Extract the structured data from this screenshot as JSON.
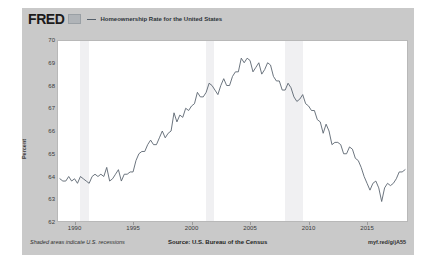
{
  "header": {
    "logo_text": "FRED",
    "logo_mark_name": "fred-graph-mark-icon",
    "series_title": "Homeownership Rate for the United States"
  },
  "footer": {
    "recession_note": "Shaded areas indicate U.S. recessions",
    "source": "Source: U.S. Bureau of the Census",
    "short_url": "myf.red/g/jA55"
  },
  "colors": {
    "card_background": "#c9c9c9",
    "plot_background": "#ffffff",
    "series_line": "#4572a7",
    "recession_band": "#f0f0f2",
    "axis_text": "#3a3a3a",
    "plot_border": "#b8b8b8"
  },
  "chart_data": {
    "type": "line",
    "title": "Homeownership Rate for the United States",
    "xlabel": "",
    "ylabel": "Percent",
    "ylim": [
      62,
      70
    ],
    "xlim": [
      1988.5,
      2018.5
    ],
    "grid": false,
    "legend_position": "top",
    "y_ticks": [
      70,
      69,
      68,
      67,
      66,
      65,
      64,
      63,
      62
    ],
    "x_ticks": [
      1990,
      1995,
      2000,
      2005,
      2010,
      2015
    ],
    "source": "U.S. Bureau of the Census",
    "recessions": [
      {
        "start": 1990.5,
        "end": 1991.25
      },
      {
        "start": 2001.25,
        "end": 2001.9
      },
      {
        "start": 2007.95,
        "end": 2009.5
      }
    ],
    "series": [
      {
        "name": "Homeownership Rate for the United States",
        "units": "Percent",
        "frequency": "Quarterly",
        "x": [
          1988.75,
          1989.0,
          1989.25,
          1989.5,
          1989.75,
          1990.0,
          1990.25,
          1990.5,
          1990.75,
          1991.0,
          1991.25,
          1991.5,
          1991.75,
          1992.0,
          1992.25,
          1992.5,
          1992.75,
          1993.0,
          1993.25,
          1993.5,
          1993.75,
          1994.0,
          1994.25,
          1994.5,
          1994.75,
          1995.0,
          1995.25,
          1995.5,
          1995.75,
          1996.0,
          1996.25,
          1996.5,
          1996.75,
          1997.0,
          1997.25,
          1997.5,
          1997.75,
          1998.0,
          1998.25,
          1998.5,
          1998.75,
          1999.0,
          1999.25,
          1999.5,
          1999.75,
          2000.0,
          2000.25,
          2000.5,
          2000.75,
          2001.0,
          2001.25,
          2001.5,
          2001.75,
          2002.0,
          2002.25,
          2002.5,
          2002.75,
          2003.0,
          2003.25,
          2003.5,
          2003.75,
          2004.0,
          2004.25,
          2004.5,
          2004.75,
          2005.0,
          2005.25,
          2005.5,
          2005.75,
          2006.0,
          2006.25,
          2006.5,
          2006.75,
          2007.0,
          2007.25,
          2007.5,
          2007.75,
          2008.0,
          2008.25,
          2008.5,
          2008.75,
          2009.0,
          2009.25,
          2009.5,
          2009.75,
          2010.0,
          2010.25,
          2010.5,
          2010.75,
          2011.0,
          2011.25,
          2011.5,
          2011.75,
          2012.0,
          2012.25,
          2012.5,
          2012.75,
          2013.0,
          2013.25,
          2013.5,
          2013.75,
          2014.0,
          2014.25,
          2014.5,
          2014.75,
          2015.0,
          2015.25,
          2015.5,
          2015.75,
          2016.0,
          2016.25,
          2016.5,
          2016.75,
          2017.0,
          2017.25,
          2017.5,
          2017.75,
          2018.0,
          2018.25
        ],
        "values": [
          63.9,
          63.8,
          63.8,
          64.0,
          63.8,
          63.9,
          63.7,
          64.0,
          63.9,
          63.8,
          63.7,
          64.0,
          64.1,
          64.0,
          64.1,
          64.0,
          64.4,
          63.8,
          63.9,
          64.1,
          64.3,
          63.8,
          64.1,
          64.1,
          64.2,
          64.2,
          64.7,
          65.0,
          65.1,
          65.1,
          65.4,
          65.6,
          65.4,
          65.4,
          65.7,
          66.0,
          65.7,
          65.9,
          66.0,
          66.8,
          66.4,
          66.7,
          66.6,
          67.0,
          66.9,
          67.1,
          67.2,
          67.7,
          67.5,
          67.5,
          67.7,
          68.1,
          68.0,
          67.8,
          67.6,
          68.0,
          68.3,
          68.0,
          68.0,
          68.4,
          68.6,
          68.6,
          69.2,
          69.0,
          69.2,
          69.1,
          68.6,
          68.8,
          69.0,
          68.5,
          68.7,
          69.0,
          68.9,
          68.4,
          68.2,
          68.2,
          67.8,
          67.8,
          68.1,
          67.9,
          67.5,
          67.3,
          67.4,
          67.6,
          67.2,
          67.1,
          66.9,
          66.9,
          66.5,
          66.4,
          65.9,
          66.3,
          66.0,
          65.4,
          65.5,
          65.5,
          65.4,
          65.0,
          65.0,
          65.3,
          65.2,
          64.8,
          64.7,
          64.4,
          64.0,
          63.7,
          63.4,
          63.7,
          63.8,
          63.5,
          62.9,
          63.5,
          63.7,
          63.6,
          63.7,
          63.9,
          64.2,
          64.2,
          64.3
        ]
      }
    ]
  }
}
